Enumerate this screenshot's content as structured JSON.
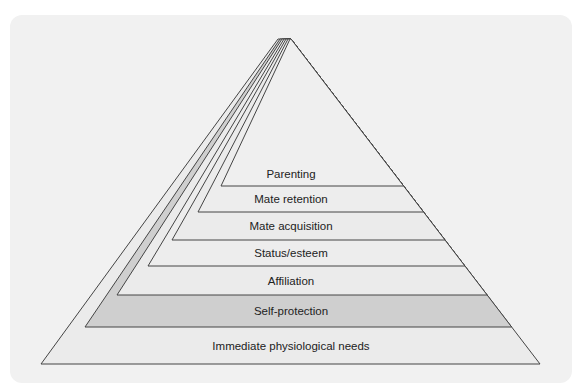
{
  "diagram": {
    "type": "pyramid",
    "colors": {
      "panel": "#f1f1f1",
      "layer_light": "#ebebeb",
      "layer_dark": "#cfcfcf",
      "stroke": "#444444"
    },
    "layers": [
      {
        "label": "Immediate physiological needs",
        "apex_x": 278,
        "top_y": 327,
        "bottom_y": 364,
        "bottom_left_x": 41,
        "fill": "#ebebeb"
      },
      {
        "label": "Self-protection",
        "apex_x": 280,
        "top_y": 295,
        "bottom_y": 327,
        "bottom_left_x": 85,
        "fill": "#cfcfcf"
      },
      {
        "label": "Affiliation",
        "apex_x": 282,
        "top_y": 266,
        "bottom_y": 295,
        "bottom_left_x": 117,
        "fill": "#ebebeb"
      },
      {
        "label": "Status/esteem",
        "apex_x": 284,
        "top_y": 240,
        "bottom_y": 266,
        "bottom_left_x": 148,
        "fill": "#ededed"
      },
      {
        "label": "Mate acquisition",
        "apex_x": 286,
        "top_y": 212,
        "bottom_y": 240,
        "bottom_left_x": 172,
        "fill": "#ebebeb"
      },
      {
        "label": "Mate retention",
        "apex_x": 288,
        "top_y": 186,
        "bottom_y": 212,
        "bottom_left_x": 198,
        "fill": "#ededed"
      },
      {
        "label": "Parenting",
        "apex_x": 290,
        "top_y": 39,
        "bottom_y": 186,
        "bottom_left_x": 221,
        "fill": "#efefef"
      }
    ],
    "apex_y": 39,
    "right_apex_x": 291,
    "base_right_x": 540,
    "base_y": 364
  }
}
